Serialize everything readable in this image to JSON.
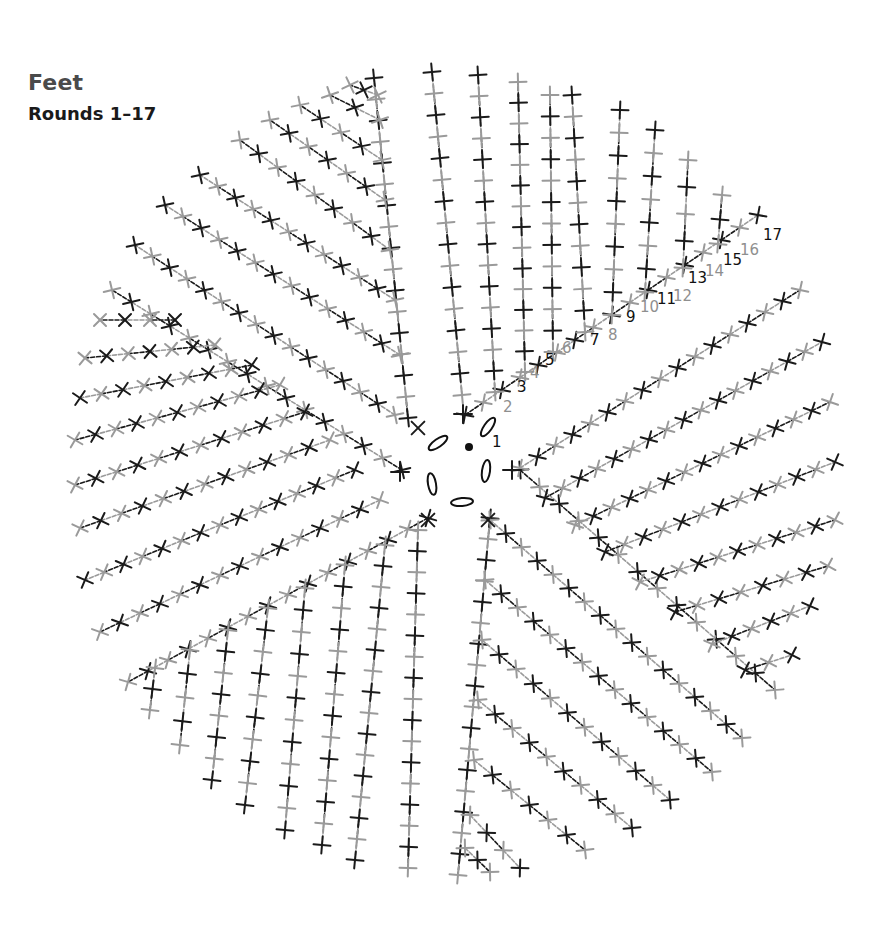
{
  "header": {
    "title": "Feet",
    "subtitle": "Rounds 1–17"
  },
  "colors": {
    "black_round": "#1a1a1a",
    "gray_round": "#9a9a9a",
    "background": "#ffffff"
  },
  "chart_data": {
    "type": "crochet-round-diagram",
    "title": "Feet",
    "subtitle": "Rounds 1–17",
    "rounds": 17,
    "wedges": 6,
    "center": {
      "x": 470,
      "y": 470
    },
    "center_symbols": {
      "magic_ring_dot": true,
      "chain_ovals": 6,
      "round1_stitches": 6
    },
    "stitch_symbol": "single crochet (+ / ×)",
    "color_alternation": "odd rounds black, even rounds gray",
    "round_labels": [
      "1",
      "2",
      "3",
      "4",
      "5",
      "6",
      "7",
      "8",
      "9",
      "10",
      "11",
      "12",
      "13",
      "14",
      "15",
      "16",
      "17"
    ],
    "round_label_colors": [
      "black",
      "gray",
      "black",
      "gray",
      "black",
      "gray",
      "black",
      "gray",
      "black",
      "gray",
      "black",
      "gray",
      "black",
      "gray",
      "black",
      "gray",
      "black"
    ]
  },
  "round_labels": [
    {
      "t": "1",
      "x": 492,
      "y": 447,
      "c": "k",
      "s": 19
    },
    {
      "t": "2",
      "x": 503,
      "y": 412,
      "c": "g",
      "s": 16
    },
    {
      "t": "3",
      "x": 517,
      "y": 392,
      "c": "k",
      "s": 16
    },
    {
      "t": "4",
      "x": 530,
      "y": 378,
      "c": "g",
      "s": 15
    },
    {
      "t": "5",
      "x": 545,
      "y": 365,
      "c": "k",
      "s": 14
    },
    {
      "t": "6",
      "x": 562,
      "y": 353,
      "c": "g",
      "s": 16
    },
    {
      "t": "7",
      "x": 590,
      "y": 345,
      "c": "k",
      "s": 15
    },
    {
      "t": "8",
      "x": 608,
      "y": 340,
      "c": "g",
      "s": 17
    },
    {
      "t": "9",
      "x": 626,
      "y": 322,
      "c": "k",
      "s": 14
    },
    {
      "t": "10",
      "x": 640,
      "y": 312,
      "c": "g",
      "s": 11
    },
    {
      "t": "11",
      "x": 657,
      "y": 304,
      "c": "k",
      "s": 10
    },
    {
      "t": "12",
      "x": 673,
      "y": 301,
      "c": "g",
      "s": 13
    },
    {
      "t": "13",
      "x": 688,
      "y": 283,
      "c": "k",
      "s": 12
    },
    {
      "t": "14",
      "x": 705,
      "y": 276,
      "c": "g",
      "s": 13
    },
    {
      "t": "15",
      "x": 723,
      "y": 265,
      "c": "k",
      "s": 11
    },
    {
      "t": "16",
      "x": 740,
      "y": 255,
      "c": "g",
      "s": 12
    },
    {
      "t": "17",
      "x": 763,
      "y": 240,
      "c": "k",
      "s": 13
    }
  ]
}
